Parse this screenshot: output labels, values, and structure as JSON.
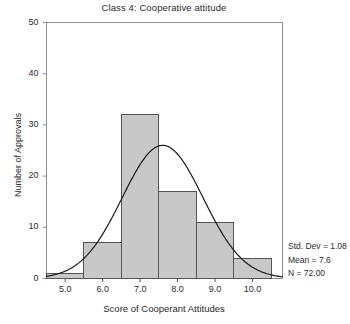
{
  "chart_data": {
    "type": "bar",
    "title": "Class 4: Cooperative attitude",
    "xlabel": "Score of Cooperant Attitudes",
    "ylabel": "Number of Approvals",
    "categories": [
      "5.0",
      "6.0",
      "7.0",
      "8.0",
      "9.0",
      "10.0"
    ],
    "values": [
      1,
      7,
      32,
      17,
      11,
      4
    ],
    "bin_width": 1.0,
    "bin_edges": [
      4.5,
      5.5,
      6.5,
      7.5,
      8.5,
      9.5,
      10.5
    ],
    "xlim": [
      4.5,
      10.8
    ],
    "ylim": [
      0,
      50
    ],
    "xticks": [
      "5.0",
      "6.0",
      "7.0",
      "8.0",
      "9.0",
      "10.0"
    ],
    "xtick_values": [
      5.0,
      6.0,
      7.0,
      8.0,
      9.0,
      10.0
    ],
    "yticks": [
      "0",
      "10",
      "20",
      "30",
      "40",
      "50"
    ],
    "ytick_values": [
      0,
      10,
      20,
      30,
      40,
      50
    ],
    "grid": false,
    "legend": "none",
    "bar_color": "#c8c8c8",
    "bar_edge_color": "#555555",
    "curve_color": "#1a1a1a",
    "overlay": {
      "type": "line",
      "name": "Normal curve",
      "mean": 7.6,
      "std_dev": 1.08,
      "n": 72,
      "peak_value": 26.0,
      "peak_x": 7.6
    },
    "annotations": [
      "Std. Dev = 1.08",
      "Mean = 7.6",
      "N = 72.00"
    ]
  },
  "statistics": {
    "std_dev_label": "Std. Dev = 1.08",
    "mean_label": "Mean = 7.6",
    "n_label": "N = 72.00"
  }
}
